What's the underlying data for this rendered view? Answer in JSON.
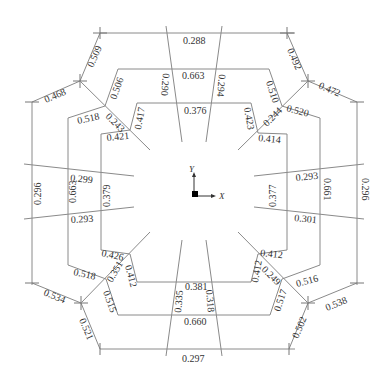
{
  "diagram": {
    "axes": {
      "x_label": "X",
      "y_label": "Y"
    },
    "colors": {
      "line": "#8a8a8a",
      "text": "#333333",
      "origin": "#000000"
    },
    "outer": {
      "top": "0.288",
      "bottom": "0.297",
      "left": "0.296",
      "right": "0.296",
      "top_left_upper": "0.509",
      "top_left_lower": "0.468",
      "top_right_upper": "0.492",
      "top_right_lower": "0.472",
      "bottom_left_upper": "0.534",
      "bottom_left_lower": "0.521",
      "bottom_right_upper": "0.538",
      "bottom_right_lower": "0.502"
    },
    "middle": {
      "top": "0.663",
      "bottom": "0.660",
      "left": "0.663",
      "right": "0.661",
      "top_left_upper": "0.506",
      "top_left_lower": "0.518",
      "top_right_upper": "0.510",
      "top_right_lower": "0.520",
      "bottom_left_upper": "0.518",
      "bottom_left_lower": "0.515",
      "bottom_right_upper": "0.516",
      "bottom_right_lower": "0.517"
    },
    "inner": {
      "top": "0.376",
      "bottom": "0.381",
      "left": "0.379",
      "right": "0.377",
      "top_left_upper": "0.417",
      "top_left_lower": "0.421",
      "top_right_upper": "0.423",
      "top_right_lower": "0.414",
      "bottom_left_upper": "0.426",
      "bottom_left_lower": "0.412",
      "bottom_right_upper": "0.412",
      "bottom_right_lower": "0.412"
    },
    "diagonals": {
      "top_left": "0.243",
      "top_right": "0.244",
      "bottom_left": "0.351",
      "bottom_right": "0.249"
    },
    "struts": {
      "top_left": "0.290",
      "top_right": "0.294",
      "bottom_left": "0.335",
      "bottom_right": "0.318",
      "left_upper": "0.299",
      "left_lower": "0.293",
      "right_upper": "0.293",
      "right_lower": "0.301"
    }
  }
}
